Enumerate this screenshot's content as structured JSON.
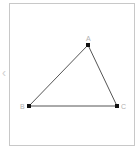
{
  "diagram": {
    "type": "triangle",
    "stroke_color": "#555555",
    "point_color": "#111111",
    "label_color": "#b0b0b0",
    "frame_border_color": "#c8c8c8",
    "points": [
      {
        "label": "A",
        "x": 88,
        "y": 45
      },
      {
        "label": "B",
        "x": 29,
        "y": 106
      },
      {
        "label": "C",
        "x": 117,
        "y": 106
      }
    ],
    "edges": [
      [
        "A",
        "B"
      ],
      [
        "B",
        "C"
      ],
      [
        "C",
        "A"
      ]
    ]
  },
  "sidebar_handle": {
    "icon": "chevron-left-icon",
    "glyph": "‹"
  }
}
